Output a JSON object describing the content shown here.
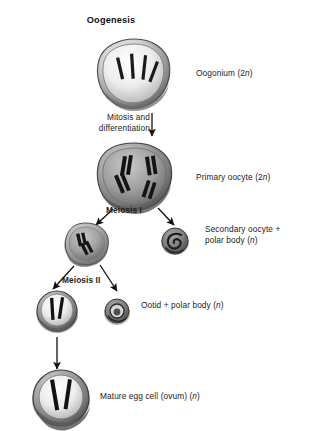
{
  "diagram": {
    "title": "Oogenesis",
    "type": "biology-process-flowchart",
    "background_color": "#ffffff",
    "text_color": "#1b1b1b"
  },
  "labels": {
    "oogonium": "Oogonium (2n)",
    "mitosis_bold": "Mitosis",
    "mitosis_rest": " and differentiation",
    "primary_oocyte": "Primary oocyte (2n)",
    "meiosis_1": "Meiosis I",
    "secondary_oocyte": "Secondary oocyte + polar body (n)",
    "meiosis_2": "Meiosis II",
    "ootid": "Ootid + polar body (n)",
    "mature_egg": "Mature egg cell (ovum) (n)"
  },
  "stages": [
    {
      "id": "oogonium",
      "label": "Oogonium (2n)",
      "ploidy": "2n",
      "chromosome_count": 4,
      "cell_size_px": 70,
      "cell_style": "large-light-interior",
      "center": {
        "x": 135,
        "y": 72
      }
    },
    {
      "id": "primary-oocyte",
      "label": "Primary oocyte (2n)",
      "ploidy": "2n",
      "chromosome_count": 4,
      "cell_size_px": 72,
      "cell_style": "large-dark-paired",
      "center": {
        "x": 135,
        "y": 176
      }
    },
    {
      "id": "secondary-oocyte",
      "label": "Secondary oocyte + polar body (n)",
      "ploidy": "n",
      "chromosome_count": 2,
      "cell_size_px": 42,
      "cell_style": "medium-two-chromosomes",
      "center": {
        "x": 86,
        "y": 243
      }
    },
    {
      "id": "first-polar-body",
      "label": "Secondary oocyte + polar body (n)",
      "ploidy": "n",
      "chromosome_count": 0,
      "cell_size_px": 26,
      "cell_style": "small-swirl",
      "center": {
        "x": 175,
        "y": 241
      }
    },
    {
      "id": "ootid",
      "label": "Ootid + polar body (n)",
      "ploidy": "n",
      "chromosome_count": 2,
      "cell_size_px": 40,
      "cell_style": "medium-two-streaks",
      "center": {
        "x": 57,
        "y": 311
      }
    },
    {
      "id": "second-polar-body",
      "label": "Ootid + polar body (n)",
      "ploidy": "n",
      "chromosome_count": 0,
      "cell_size_px": 24,
      "cell_style": "small-ring",
      "center": {
        "x": 117,
        "y": 311
      }
    },
    {
      "id": "mature-egg",
      "label": "Mature egg cell (ovum) (n)",
      "ploidy": "n",
      "chromosome_count": 2,
      "cell_size_px": 54,
      "cell_style": "large-two-streaks",
      "center": {
        "x": 61,
        "y": 398
      }
    }
  ],
  "arrows": [
    {
      "id": "mitosis-arrow",
      "label": "Mitosis and differentiation",
      "from": "oogonium",
      "to": "primary-oocyte",
      "direction": "down"
    },
    {
      "id": "meiosis1-left-arrow",
      "label": "Meiosis I",
      "from": "primary-oocyte",
      "to": "secondary-oocyte",
      "direction": "down-left"
    },
    {
      "id": "meiosis1-right-arrow",
      "label": "Meiosis I",
      "from": "primary-oocyte",
      "to": "first-polar-body",
      "direction": "down-right"
    },
    {
      "id": "meiosis2-left-arrow",
      "label": "Meiosis II",
      "from": "secondary-oocyte",
      "to": "ootid",
      "direction": "down-left"
    },
    {
      "id": "meiosis2-right-arrow",
      "label": "Meiosis II",
      "from": "secondary-oocyte",
      "to": "second-polar-body",
      "direction": "down-right"
    },
    {
      "id": "maturation-arrow",
      "label": "",
      "from": "ootid",
      "to": "mature-egg",
      "direction": "down"
    }
  ]
}
